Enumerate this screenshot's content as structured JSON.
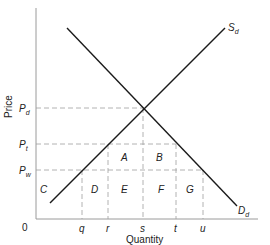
{
  "diagram": {
    "type": "supply-demand-tariff",
    "axes": {
      "x_label": "Quantity",
      "y_label": "Price",
      "origin_label": "0"
    },
    "curves": {
      "supply": {
        "label_main": "S",
        "label_sub": "d"
      },
      "demand": {
        "label_main": "D",
        "label_sub": "d"
      }
    },
    "price_levels": [
      {
        "main": "P",
        "sub": "d"
      },
      {
        "main": "P",
        "sub": "t"
      },
      {
        "main": "P",
        "sub": "w"
      }
    ],
    "quantity_marks": [
      "q",
      "r",
      "s",
      "t",
      "u"
    ],
    "areas": [
      "A",
      "B",
      "C",
      "D",
      "E",
      "F",
      "G"
    ],
    "colors": {
      "line": "#1a1a1a",
      "axis": "#9a9a9a",
      "dash": "#a0a0a0",
      "text": "#222222"
    }
  }
}
